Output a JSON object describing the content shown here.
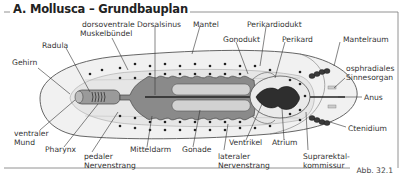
{
  "title": "A. Mollusca – Grundbauplan",
  "figure_number": "Abb. 32.1",
  "colors": {
    "mantle_fill": "#f1f1f1",
    "foot_fill": "#e4e4e4",
    "gut_fill": "#8a8a8a",
    "gonad_fill": "#d2d2d2",
    "heart_fill": "#2e2e2e",
    "outline": "#555555",
    "text": "#333333"
  },
  "labels": {
    "dorsoventrale_1": "dorsoventrale",
    "dorsoventrale_2": "Muskelbündel",
    "dorsalsinus": "Dorsalsinus",
    "mantel": "Mantel",
    "perikardiodukt": "Perikardiodukt",
    "gonodukt": "Gonodukt",
    "perikard": "Perikard",
    "mantelraum": "Mantelraum",
    "radula": "Radula",
    "gehirn": "Gehirn",
    "osphradiales_1": "osphradiales",
    "osphradiales_2": "Sinnesorgan",
    "anus": "Anus",
    "ctenidium": "Ctenidium",
    "ventraler_1": "ventraler",
    "ventraler_2": "Mund",
    "pharynx": "Pharynx",
    "pedaler_1": "pedaler",
    "pedaler_2": "Nervenstrang",
    "mitteldarm": "Mitteldarm",
    "gonade": "Gonade",
    "ventrikel": "Ventrikel",
    "atrium": "Atrium",
    "lateraler_1": "lateraler",
    "lateraler_2": "Nervenstrang",
    "suprarektal_1": "Suprarektal-",
    "suprarektal_2": "kommissur"
  }
}
